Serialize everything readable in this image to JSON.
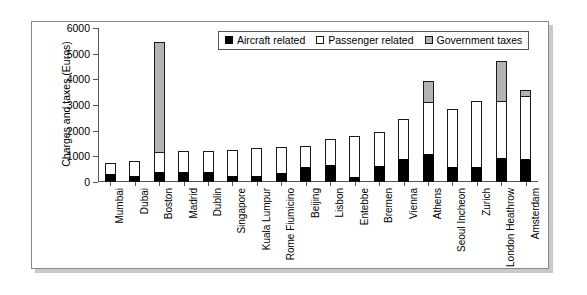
{
  "chart_data": {
    "type": "bar",
    "stacked": true,
    "title": "",
    "xlabel": "",
    "ylabel": "Charges and taxes (Euros)",
    "ylim": [
      0,
      6000
    ],
    "ytick_step": 1000,
    "yticks": [
      "0",
      "1000",
      "2000",
      "3000",
      "4000",
      "5000",
      "6000"
    ],
    "grid": false,
    "legend_position": "top-center-inside",
    "categories": [
      "Mumbai",
      "Dubai",
      "Boston",
      "Madrid",
      "Dublin",
      "Singapore",
      "Kuala Lumpur",
      "Rome Fiumicino",
      "Beijing",
      "Lisbon",
      "Entebbe",
      "Bremen",
      "Vienna",
      "Athens",
      "Seoul Incheon",
      "Zurich",
      "London Heathrow",
      "Amsterdam"
    ],
    "series": [
      {
        "name": "Aircraft related",
        "color": "#000000",
        "values": [
          320,
          230,
          400,
          400,
          400,
          230,
          220,
          350,
          600,
          680,
          200,
          620,
          900,
          1080,
          600,
          600,
          950,
          900
        ]
      },
      {
        "name": "Passenger related",
        "color": "#ffffff",
        "values": [
          430,
          600,
          750,
          800,
          790,
          1020,
          1100,
          1000,
          800,
          990,
          1600,
          1330,
          1550,
          2020,
          2250,
          2550,
          2200,
          2450
        ]
      },
      {
        "name": "Government taxes",
        "color": "#b3b3b3",
        "values": [
          0,
          0,
          4300,
          0,
          0,
          0,
          0,
          0,
          0,
          0,
          0,
          0,
          0,
          850,
          0,
          0,
          1550,
          250
        ]
      }
    ],
    "totals": [
      750,
      830,
      5450,
      1200,
      1190,
      1250,
      1320,
      1350,
      1400,
      1670,
      1800,
      1950,
      2450,
      3950,
      2850,
      3150,
      4700,
      3600
    ]
  },
  "legend": {
    "items": [
      {
        "label": "Aircraft related",
        "swatch": "black-square-icon"
      },
      {
        "label": "Passenger related",
        "swatch": "white-square-icon"
      },
      {
        "label": "Government taxes",
        "swatch": "gray-square-icon"
      }
    ]
  }
}
